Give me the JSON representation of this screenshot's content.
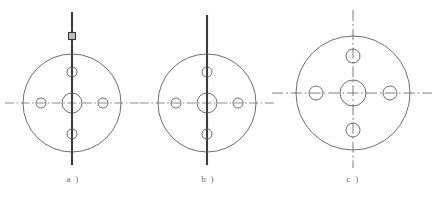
{
  "figure": {
    "background_color": "#ffffff",
    "line_color": "#4a4a4a",
    "centerline_color": "#6e6e6e",
    "heavy_line_color": "#3c3c3c",
    "label_color": "#6b6b6b",
    "caption_a": "a )",
    "caption_b": "b )",
    "caption_c": "c )",
    "subfigures": [
      {
        "id": "a",
        "caption": "a )",
        "center_x": 72,
        "center_y": 103,
        "outer_radius": 49,
        "center_hole_radius": 10,
        "bolt_hole_radius": 5,
        "bolt_circle_radius": 31,
        "bolt_hole_count": 4,
        "bolt_hole_angles_deg": [
          0,
          90,
          180,
          270
        ],
        "vertical_axis_style": "heavy-solid",
        "vertical_axis_top": 12,
        "vertical_axis_bottom": 165,
        "horizontal_axis_style": "dash-dot",
        "horizontal_axis_left": 5,
        "horizontal_axis_right": 139,
        "marker": {
          "type": "square-marker",
          "x": 72,
          "y": 36,
          "size": 7
        }
      },
      {
        "id": "b",
        "caption": "b )",
        "center_x": 207,
        "center_y": 103,
        "outer_radius": 49,
        "center_hole_radius": 10,
        "bolt_hole_radius": 5,
        "bolt_circle_radius": 31,
        "bolt_hole_count": 4,
        "bolt_hole_angles_deg": [
          0,
          90,
          180,
          270
        ],
        "vertical_axis_style": "heavy-solid",
        "vertical_axis_top": 15,
        "vertical_axis_bottom": 165,
        "horizontal_axis_style": "dash-dot",
        "horizontal_axis_left": 140,
        "horizontal_axis_right": 276,
        "marker": null
      },
      {
        "id": "c",
        "caption": "c )",
        "center_x": 353,
        "center_y": 93,
        "outer_radius": 57,
        "center_hole_radius": 13,
        "bolt_hole_radius": 7,
        "bolt_circle_radius": 37,
        "bolt_hole_count": 4,
        "bolt_hole_angles_deg": [
          0,
          90,
          180,
          270
        ],
        "vertical_axis_style": "dash-dot",
        "vertical_axis_top": 10,
        "vertical_axis_bottom": 168,
        "horizontal_axis_style": "dash-dot",
        "horizontal_axis_left": 272,
        "horizontal_axis_right": 432,
        "marker": null
      }
    ]
  }
}
